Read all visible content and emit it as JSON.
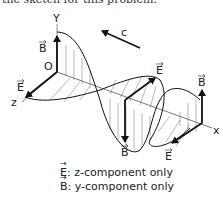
{
  "caption": "the sketch for this problem.",
  "diagram": {
    "axis_labels": {
      "y": "Y",
      "z": "z",
      "x": "x",
      "origin": "O"
    },
    "wave_speed_label": "c",
    "vectors": {
      "E": "E",
      "B": "B"
    }
  },
  "legend": [
    {
      "symbol": "E",
      "text": ": z-component only"
    },
    {
      "symbol": "B",
      "text": ": y-component only"
    }
  ]
}
